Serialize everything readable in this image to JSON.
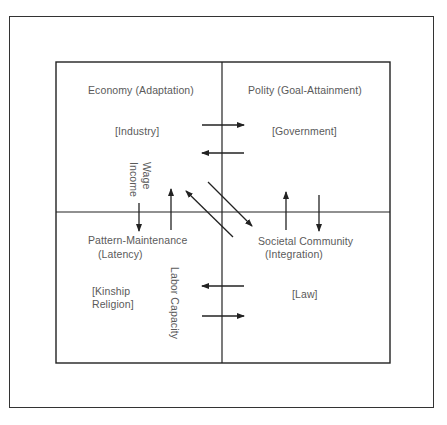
{
  "quadrants": {
    "top_left": {
      "title": "Economy (Adaptation)",
      "example": "[Industry]"
    },
    "top_right": {
      "title": "Polity (Goal-Attainment)",
      "example": "[Government]"
    },
    "bottom_left": {
      "title_line1": "Pattern-Maintenance",
      "title_line2": "(Latency)",
      "example_line1": "[Kinship",
      "example_line2": "Religion]"
    },
    "bottom_right": {
      "title_line1": "Societal Community",
      "title_line2": "(Integration)",
      "example": "[Law]"
    }
  },
  "exchange_labels": {
    "wage": "Wage",
    "income": "Income",
    "labor_capacity": "Labor Capacity"
  },
  "colors": {
    "line": "#222222",
    "text": "#5a5a5a"
  }
}
